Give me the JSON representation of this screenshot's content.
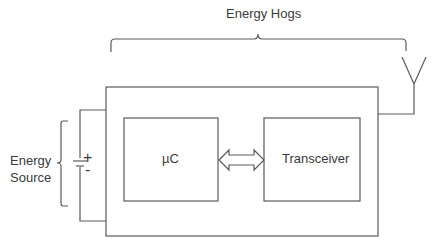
{
  "diagram": {
    "title_brace_label": "Energy Hogs",
    "source_label_line1": "Energy",
    "source_label_line2": "Source",
    "microcontroller_label": "µC",
    "transceiver_label": "Transceiver",
    "battery_plus": "+",
    "battery_minus": "-",
    "stroke_color": "#5a5a5a"
  }
}
